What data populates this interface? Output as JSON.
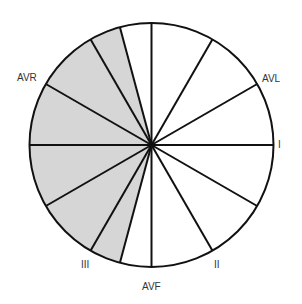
{
  "diagram": {
    "type": "hexaxial-reference-wheel",
    "center": [
      151.5,
      145
    ],
    "radius": 122,
    "stroke_color": "#111111",
    "fill_color": "#d6d6d6",
    "spoke_angles_deg": [
      0,
      30,
      60,
      90,
      105,
      120,
      150,
      180,
      210,
      240,
      255,
      270,
      300,
      330
    ],
    "shaded_sector_deg": [
      105,
      255
    ],
    "labels": [
      {
        "id": "I",
        "text": "I",
        "x": 278,
        "y": 140
      },
      {
        "id": "AVL",
        "text": "AVL",
        "x": 262,
        "y": 74
      },
      {
        "id": "AVR",
        "text": "AVR",
        "x": 17,
        "y": 73
      },
      {
        "id": "III",
        "text": "III",
        "x": 81,
        "y": 260
      },
      {
        "id": "AVF",
        "text": "AVF",
        "x": 142,
        "y": 282
      },
      {
        "id": "II",
        "text": "II",
        "x": 214,
        "y": 260
      }
    ]
  }
}
